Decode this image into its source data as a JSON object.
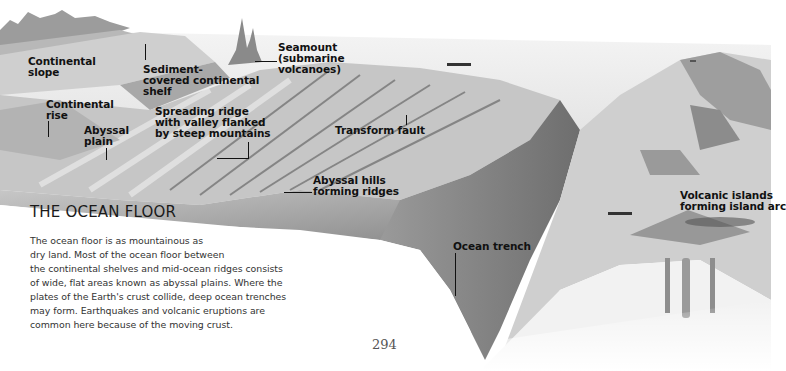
{
  "diagram": {
    "title": "THE OCEAN FLOOR",
    "labels": {
      "continental_slope": "Continental\nslope",
      "sediment_shelf": "Sediment-\ncovered continental\nshelf",
      "seamount": "Seamount\n(submarine\nvolcanoes)",
      "continental_rise": "Continental\nrise",
      "abyssal_plain": "Abyssal\nplain",
      "spreading_ridge": "Spreading ridge\nwith valley flanked\nby steep mountains",
      "transform_fault": "Transform fault",
      "abyssal_hills": "Abyssal hills\nforming ridges",
      "volcanic_islands": "Volcanic islands\nforming island arc",
      "ocean_trench": "Ocean trench"
    }
  },
  "text": {
    "lines": [
      "The ocean floor is as mountainous as",
      "dry land. Most of the ocean floor between",
      "the continental shelves and mid-ocean ridges consists",
      "of wide, flat areas known as abyssal plains. Where the",
      "plates of the Earth's crust collide, deep ocean trenches",
      "may form. Earthquakes and volcanic eruptions are",
      "common here because of the moving crust."
    ]
  },
  "page": {
    "number": "294"
  },
  "colors": {
    "ink": "#111111",
    "body_text": "#333333",
    "terrain_light": "#d9d9d9",
    "terrain_dark": "#8a8a8a"
  }
}
